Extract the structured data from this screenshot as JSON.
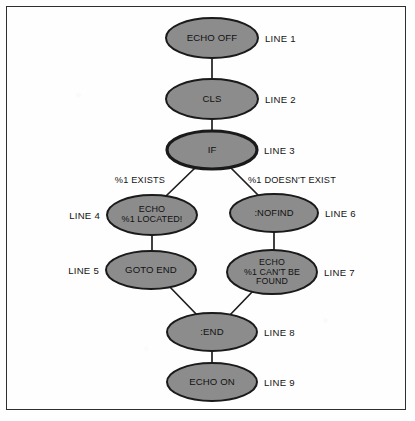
{
  "diagram": {
    "colors": {
      "node_fill": "#8c8c8c",
      "node_stroke": "#1a1a1a",
      "connector": "#1f1f1f",
      "frame": "#2f2f2f",
      "background": "#fefefe",
      "text": "#111111"
    },
    "nodes": [
      {
        "id": "echo-off",
        "text": "ECHO OFF",
        "lines": [
          "ECHO OFF"
        ],
        "line_tag": "LINE 1",
        "tag_side": "right",
        "cx": 212,
        "cy": 38,
        "rx": 46,
        "ry": 20,
        "font_size": 9.6,
        "stroke_width": 2.0
      },
      {
        "id": "cls",
        "text": "CLS",
        "lines": [
          "CLS"
        ],
        "line_tag": "LINE 2",
        "tag_side": "right",
        "cx": 212,
        "cy": 99,
        "rx": 46,
        "ry": 20,
        "font_size": 9.6,
        "stroke_width": 2.0
      },
      {
        "id": "if",
        "text": "IF",
        "lines": [
          "IF"
        ],
        "line_tag": "LINE 3",
        "tag_side": "right",
        "cx": 212,
        "cy": 150,
        "rx": 45,
        "ry": 19,
        "font_size": 9.6,
        "stroke_width": 3.2
      },
      {
        "id": "echo-located",
        "text": "ECHO %1 LOCATED!",
        "lines": [
          "ECHO",
          "%1 LOCATED!"
        ],
        "line_tag": "LINE 4",
        "tag_side": "left",
        "cx": 152,
        "cy": 215,
        "rx": 45,
        "ry": 20,
        "font_size": 9.0,
        "stroke_width": 2.0
      },
      {
        "id": "nofind",
        "text": ":NOFIND",
        "lines": [
          ":NOFIND"
        ],
        "line_tag": "LINE 6",
        "tag_side": "right",
        "cx": 274,
        "cy": 213,
        "rx": 44,
        "ry": 19,
        "font_size": 9.4,
        "stroke_width": 2.0
      },
      {
        "id": "goto-end",
        "text": "GOTO END",
        "lines": [
          "GOTO END"
        ],
        "line_tag": "LINE 5",
        "tag_side": "left",
        "cx": 151,
        "cy": 270,
        "rx": 45,
        "ry": 19,
        "font_size": 9.6,
        "stroke_width": 2.0
      },
      {
        "id": "echo-not-found",
        "text": "ECHO %1 CAN'T BE FOUND",
        "lines": [
          "ECHO",
          "%1 CAN'T BE",
          "FOUND"
        ],
        "line_tag": "LINE 7",
        "tag_side": "right",
        "cx": 272,
        "cy": 272,
        "rx": 45,
        "ry": 22,
        "font_size": 8.8,
        "stroke_width": 2.0
      },
      {
        "id": "end",
        "text": ":END",
        "lines": [
          ":END"
        ],
        "line_tag": "LINE 8",
        "tag_side": "right",
        "cx": 212,
        "cy": 332,
        "rx": 45,
        "ry": 19,
        "font_size": 9.6,
        "stroke_width": 2.0
      },
      {
        "id": "echo-on",
        "text": "ECHO ON",
        "lines": [
          "ECHO ON"
        ],
        "line_tag": "LINE 9",
        "tag_side": "right",
        "cx": 212,
        "cy": 382,
        "rx": 45,
        "ry": 19,
        "font_size": 9.6,
        "stroke_width": 2.0
      }
    ],
    "edges": [
      {
        "id": "e1",
        "from": "echo-off",
        "to": "cls",
        "x1": 212,
        "y1": 58,
        "x2": 212,
        "y2": 79
      },
      {
        "id": "e2",
        "from": "cls",
        "to": "if",
        "x1": 212,
        "y1": 119,
        "x2": 212,
        "y2": 131
      },
      {
        "id": "e3",
        "from": "if",
        "to": "echo-located",
        "x1": 196,
        "y1": 167,
        "x2": 166,
        "y2": 196,
        "label": "%1 EXISTS",
        "label_x": 140,
        "label_y": 180
      },
      {
        "id": "e4",
        "from": "if",
        "to": "nofind",
        "x1": 229,
        "y1": 166,
        "x2": 258,
        "y2": 195,
        "label": "%1 DOESN'T EXIST",
        "label_x": 292,
        "label_y": 180
      },
      {
        "id": "e5",
        "from": "echo-located",
        "to": "goto-end",
        "x1": 152,
        "y1": 235,
        "x2": 152,
        "y2": 251
      },
      {
        "id": "e6",
        "from": "nofind",
        "to": "echo-not-found",
        "x1": 274,
        "y1": 232,
        "x2": 274,
        "y2": 250
      },
      {
        "id": "e7",
        "from": "goto-end",
        "to": "end",
        "x1": 168,
        "y1": 285,
        "x2": 198,
        "y2": 316
      },
      {
        "id": "e8",
        "from": "echo-not-found",
        "to": "end",
        "x1": 254,
        "y1": 290,
        "x2": 228,
        "y2": 317
      },
      {
        "id": "e9",
        "from": "end",
        "to": "echo-on",
        "x1": 212,
        "y1": 351,
        "x2": 212,
        "y2": 363
      }
    ]
  }
}
